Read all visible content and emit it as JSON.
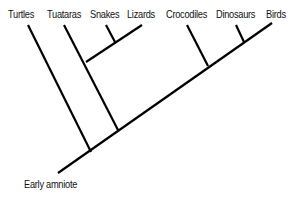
{
  "diagram": {
    "type": "cladogram",
    "root_label": "Early amniote",
    "taxa": [
      "Turtles",
      "Tuataras",
      "Snakes",
      "Lizards",
      "Crocodiles",
      "Dinosaurs",
      "Birds"
    ],
    "line_color": "#000000",
    "clades": [
      {
        "members": [
          "Snakes",
          "Lizards"
        ]
      },
      {
        "members": [
          "Tuataras",
          "Snakes",
          "Lizards"
        ]
      },
      {
        "members": [
          "Dinosaurs",
          "Birds"
        ]
      },
      {
        "members": [
          "Crocodiles",
          "Dinosaurs",
          "Birds"
        ]
      }
    ]
  }
}
